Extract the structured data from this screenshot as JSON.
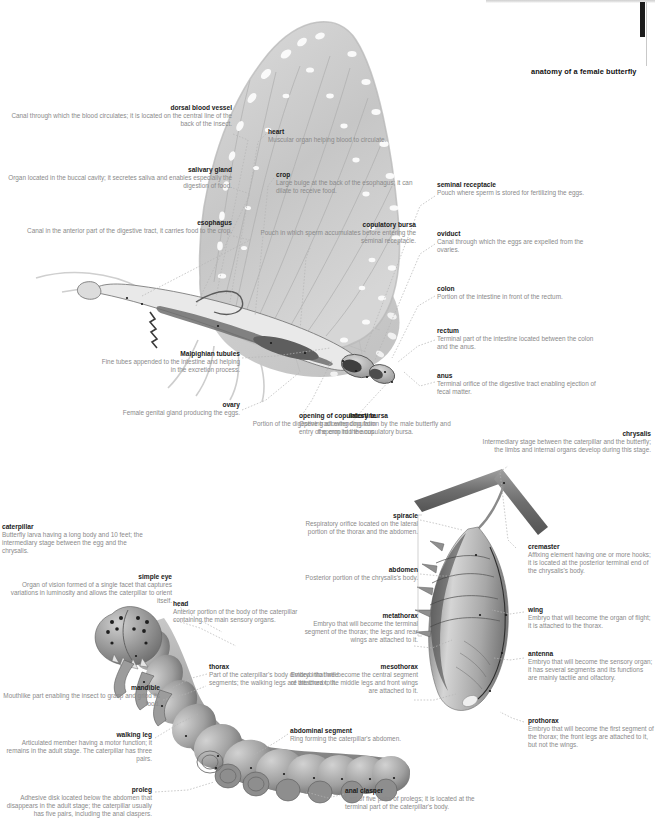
{
  "title": "anatomy of a female butterfly",
  "colors": {
    "label_heading": "#1a1a1a",
    "label_text": "#8a8a8a",
    "leader_line": "#b4b4b4",
    "background": "#ffffff",
    "artwork_gray": "#9a9a9a",
    "scrollbar": "#1b1b1b"
  },
  "figures": [
    {
      "name": "butterfly-figure",
      "caption": "anatomy of a female butterfly"
    },
    {
      "name": "caterpillar-figure",
      "caption": "caterpillar"
    },
    {
      "name": "chrysalis-figure",
      "caption": "chrysalis"
    }
  ],
  "butterfly_labels": [
    {
      "term": "dorsal blood vessel",
      "desc": "Canal through which the blood circulates; it is located on the central line of the back of the insect.",
      "align": "right",
      "x": 0,
      "y": 104,
      "w": 232
    },
    {
      "term": "salivary gland",
      "desc": "Organ located in the buccal cavity; it secretes saliva and enables especially the digestion of food.",
      "align": "right",
      "x": 0,
      "y": 166,
      "w": 232
    },
    {
      "term": "esophagus",
      "desc": "Canal in the anterior part of the digestive tract, it carries food to the crop.",
      "align": "right",
      "x": 0,
      "y": 219,
      "w": 232
    },
    {
      "term": "heart",
      "desc": "Muscular organ helping blood to circulate.",
      "align": "left",
      "x": 268,
      "y": 128,
      "w": 160
    },
    {
      "term": "crop",
      "desc": "Large bulge at the back of the esophagus; it can dilate to receive food.",
      "align": "left",
      "x": 276,
      "y": 171,
      "w": 150
    },
    {
      "term": "copulatory bursa",
      "desc": "Pouch in which sperm accumulates before entering the seminal receptacle.",
      "align": "right",
      "x": 240,
      "y": 221,
      "w": 176
    },
    {
      "term": "seminal receptacle",
      "desc": "Pouch where sperm is stored for fertilizing the eggs.",
      "align": "left",
      "x": 437,
      "y": 181,
      "w": 160
    },
    {
      "term": "oviduct",
      "desc": "Canal through which the eggs are expelled from the ovaries.",
      "align": "left",
      "x": 437,
      "y": 230,
      "w": 160
    },
    {
      "term": "colon",
      "desc": "Portion of the intestine in front of the rectum.",
      "align": "left",
      "x": 437,
      "y": 285,
      "w": 160
    },
    {
      "term": "rectum",
      "desc": "Terminal part of the intestine located between the colon and the anus.",
      "align": "left",
      "x": 437,
      "y": 327,
      "w": 160
    },
    {
      "term": "anus",
      "desc": "Terminal orifice of the digestive tract enabling ejection of fecal matter.",
      "align": "left",
      "x": 437,
      "y": 372,
      "w": 160
    },
    {
      "term": "Malpighian tubules",
      "desc": "Fine tubes appended to the intestine and helping in the excretion process.",
      "align": "right",
      "x": 96,
      "y": 350,
      "w": 144
    },
    {
      "term": "ovary",
      "desc": "Female genital gland producing the eggs.",
      "align": "right",
      "x": 36,
      "y": 401,
      "w": 204
    },
    {
      "term": "intestine",
      "desc": "Portion of the digestive tract extending from the crop to the anus.",
      "align": "right",
      "x": 248,
      "y": 412,
      "w": 128
    },
    {
      "term": "opening of copulatory bursa",
      "desc": "Opening allowing copulation by the male butterfly and entry of sperm into the copulatory bursa.",
      "align": "left",
      "x": 299,
      "y": 412,
      "w": 160
    }
  ],
  "chrysalis_labels": [
    {
      "term": "chrysalis",
      "desc": "Intermediary stage between the caterpillar and the butterfly; the limbs and internal organs develop during this stage.",
      "align": "right",
      "x": 479,
      "y": 430,
      "w": 172
    },
    {
      "term": "cremaster",
      "desc": "Affixing element having one or more hooks; it is located at the posterior terminal end of the chrysalis's body.",
      "align": "left",
      "x": 528,
      "y": 543,
      "w": 126
    },
    {
      "term": "wing",
      "desc": "Embryo that will become the organ of flight; it is attached to the thorax.",
      "align": "left",
      "x": 528,
      "y": 606,
      "w": 126
    },
    {
      "term": "antenna",
      "desc": "Embryo that will become the sensory organ; it has several segments and its functions are mainly tactile and olfactory.",
      "align": "left",
      "x": 528,
      "y": 650,
      "w": 126
    },
    {
      "term": "prothorax",
      "desc": "Embryo that will become the first segment of the thorax; the front legs are attached to it, but not the wings.",
      "align": "left",
      "x": 528,
      "y": 717,
      "w": 126
    },
    {
      "term": "spiracle",
      "desc": "Respiratory orifice located on the lateral portion of the thorax and the abdomen.",
      "align": "right",
      "x": 288,
      "y": 512,
      "w": 130
    },
    {
      "term": "abdomen",
      "desc": "Posterior portion of the chrysalis's body.",
      "align": "right",
      "x": 288,
      "y": 566,
      "w": 130
    },
    {
      "term": "metathorax",
      "desc": "Embryo that will become the terminal segment of the thorax; the legs and rear wings are attached to it.",
      "align": "right",
      "x": 288,
      "y": 612,
      "w": 130
    },
    {
      "term": "mesothorax",
      "desc": "Embryo that will become the central segment of the thorax; the middle legs and front wings are attached to it.",
      "align": "right",
      "x": 288,
      "y": 663,
      "w": 130
    }
  ],
  "caterpillar_labels": [
    {
      "term": "caterpillar",
      "desc": "Butterfly larva having a long body and 10 feet; the intermediary stage between the egg and the chrysalis.",
      "align": "left",
      "x": 2,
      "y": 523,
      "w": 142
    },
    {
      "term": "simple eye",
      "desc": "Organ of vision formed of a single facet that captures variations in luminosity and allows the caterpillar to orient itself.",
      "align": "right",
      "x": 0,
      "y": 573,
      "w": 172
    },
    {
      "term": "head",
      "desc": "Anterior portion of the body of the caterpillar containing the main sensory organs.",
      "align": "left",
      "x": 173,
      "y": 600,
      "w": 130
    },
    {
      "term": "mandible",
      "desc": "Mouthlike part enabling the insect to grasp and grind its food.",
      "align": "right",
      "x": 0,
      "y": 684,
      "w": 160
    },
    {
      "term": "thorax",
      "desc": "Part of the caterpillar's body divided into three segments; the walking legs are attached to it.",
      "align": "left",
      "x": 209,
      "y": 663,
      "w": 132
    },
    {
      "term": "walking leg",
      "desc": "Articulated member having a motor function; it remains in the adult stage. The caterpillar has three pairs.",
      "align": "right",
      "x": 0,
      "y": 731,
      "w": 152
    },
    {
      "term": "proleg",
      "desc": "Adhesive disk located below the abdomen that disappears in the adult stage; the caterpillar usually has five pairs, including the anal claspers.",
      "align": "right",
      "x": 0,
      "y": 786,
      "w": 152
    },
    {
      "term": "abdominal segment",
      "desc": "Ring forming the caterpillar's abdomen.",
      "align": "left",
      "x": 290,
      "y": 727,
      "w": 130
    },
    {
      "term": "anal clasper",
      "desc": "Last of five pairs of prolegs; it is located at the terminal part of the caterpillar's body.",
      "align": "left",
      "x": 345,
      "y": 787,
      "w": 130
    }
  ]
}
